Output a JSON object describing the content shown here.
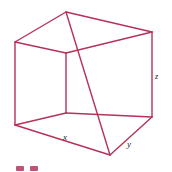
{
  "figure": {
    "name": "wireframe-rectangular-box",
    "background_color": "#ffffff",
    "line_color": "#b5325a",
    "line_width": 1.4,
    "label_color": "#1a1a1a",
    "canvas": {
      "width": 172,
      "height": 172
    }
  },
  "vertices": {
    "top_back": {
      "x": 66,
      "y": 12
    },
    "top_left": {
      "x": 15,
      "y": 42
    },
    "top_right": {
      "x": 152,
      "y": 32
    },
    "top_front": {
      "x": 66,
      "y": 53
    },
    "bottom_left": {
      "x": 15,
      "y": 125
    },
    "bottom_right": {
      "x": 152,
      "y": 117
    },
    "bottom_front": {
      "x": 110,
      "y": 155
    },
    "bottom_back": {
      "x": 66,
      "y": 113
    }
  },
  "edges": [
    {
      "name": "top-back-to-top-left",
      "from": "top_back",
      "to": "top_left"
    },
    {
      "name": "top-back-to-top-right",
      "from": "top_back",
      "to": "top_right"
    },
    {
      "name": "top-left-to-top-front",
      "from": "top_left",
      "to": "top_front"
    },
    {
      "name": "top-right-to-top-front",
      "from": "top_right",
      "to": "top_front"
    },
    {
      "name": "vertical-left",
      "from": "top_left",
      "to": "bottom_left"
    },
    {
      "name": "vertical-right",
      "from": "top_right",
      "to": "bottom_right"
    },
    {
      "name": "vertical-front-interior",
      "from": "top_front",
      "to": "bottom_back"
    },
    {
      "name": "vertical-back",
      "from": "top_back",
      "to": "bottom_front"
    },
    {
      "name": "bottom-left-to-bottom-front",
      "from": "bottom_left",
      "to": "bottom_front"
    },
    {
      "name": "bottom-right-to-bottom-front",
      "from": "bottom_right",
      "to": "bottom_front"
    },
    {
      "name": "bottom-left-to-bottom-back",
      "from": "bottom_left",
      "to": "bottom_back"
    },
    {
      "name": "bottom-right-to-bottom-back",
      "from": "bottom_right",
      "to": "bottom_back"
    }
  ],
  "labels": {
    "x": "x",
    "y": "y",
    "z": "z"
  },
  "caption_fragment": {
    "visible": true,
    "description": "Two small clipped pink glyph tops at the very bottom edge of the cropped figure",
    "color": "#c35175"
  }
}
